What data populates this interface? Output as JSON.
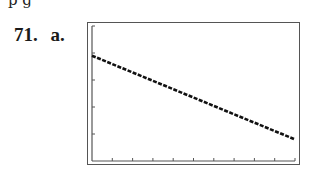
{
  "page": {
    "cut_text": "p  g",
    "problem_number": "71.",
    "part_label": "a."
  },
  "chart_data": {
    "type": "line",
    "title": "",
    "xlabel": "",
    "ylabel": "",
    "grid": false,
    "legend": null,
    "x_ticks_count": 10,
    "y_ticks_count": 5,
    "xlim": [
      0,
      10
    ],
    "ylim": [
      0,
      5
    ],
    "series": [
      {
        "name": "line",
        "x": [
          0,
          10
        ],
        "y": [
          3.9,
          0.8
        ]
      }
    ],
    "style": "calculator screen graph, decreasing linear function, dotted pixel line"
  }
}
